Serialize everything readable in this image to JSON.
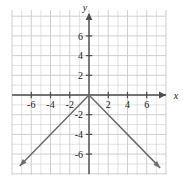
{
  "chart_data": {
    "type": "line",
    "title": "",
    "xlabel": "x",
    "ylabel": "y",
    "xlim": [
      -8,
      8
    ],
    "ylim": [
      -7.2,
      8
    ],
    "grid": true,
    "grid_step": 1,
    "legend": "none",
    "x_tick_labels": [
      "-6",
      "-4",
      "-2",
      "2",
      "4",
      "6"
    ],
    "x_tick_values": [
      -6,
      -4,
      -2,
      2,
      4,
      6
    ],
    "y_tick_labels": [
      "6",
      "4",
      "2",
      "-2",
      "-4",
      "-6"
    ],
    "y_tick_values": [
      6,
      4,
      2,
      -2,
      -4,
      -6
    ],
    "series": [
      {
        "name": "y = -|x|",
        "points": [
          [
            -7.2,
            -7.2
          ],
          [
            0,
            0
          ],
          [
            7.4,
            -7.4
          ]
        ],
        "color": "#6b6b6b",
        "arrow_start": true,
        "arrow_end": true
      }
    ],
    "vertex": [
      0,
      0
    ],
    "left_slope": 1,
    "right_slope": -1
  },
  "axes": {
    "x_label": "x",
    "y_label": "y",
    "axis_color": "#4d4d4d",
    "grid_color": "#c9c9c9"
  },
  "ticks": {
    "x": [
      {
        "label": "-6",
        "value": -6
      },
      {
        "label": "-4",
        "value": -4
      },
      {
        "label": "-2",
        "value": -2
      },
      {
        "label": "2",
        "value": 2
      },
      {
        "label": "4",
        "value": 4
      },
      {
        "label": "6",
        "value": 6
      }
    ],
    "y": [
      {
        "label": "6",
        "value": 6
      },
      {
        "label": "4",
        "value": 4
      },
      {
        "label": "2",
        "value": 2
      },
      {
        "label": "-2",
        "value": -2
      },
      {
        "label": "-4",
        "value": -4
      },
      {
        "label": "-6",
        "value": -6
      }
    ]
  }
}
